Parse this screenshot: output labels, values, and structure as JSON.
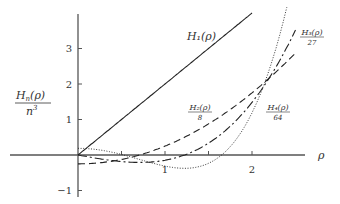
{
  "chart_data": {
    "type": "line",
    "title": "",
    "xlabel": "ρ",
    "ylabel": "H_n(ρ) / n^3",
    "ylabel_parts": {
      "num": "H",
      "num_sub": "n",
      "num_arg": "(ρ)",
      "den": "n",
      "den_sup": "3"
    },
    "xlim": [
      -0.9,
      2.5
    ],
    "ylim": [
      -1.15,
      4.0
    ],
    "x_ticks": [
      0.5,
      1,
      1.5,
      2
    ],
    "x_tick_labels": {
      "1": "1",
      "2": "2"
    },
    "y_ticks": [
      -1,
      1,
      2,
      3
    ],
    "y_tick_labels": [
      "−1",
      "1",
      "2",
      "3"
    ],
    "grid": false,
    "legend": "inline labels",
    "series": [
      {
        "name": "H1(ρ)",
        "label": "H₁(ρ)",
        "formula": "2ρ",
        "style": "solid",
        "domain": [
          0,
          2.0
        ],
        "x": [
          0,
          0.5,
          1.0,
          1.5,
          2.0
        ],
        "values": [
          0,
          1.0,
          2.0,
          3.0,
          4.0
        ]
      },
      {
        "name": "H2(ρ)/8",
        "label_num": "H₂(ρ)",
        "label_den": "8",
        "formula": "(4ρ²−2)/8",
        "style": "dashed",
        "domain": [
          0,
          2.5
        ],
        "x": [
          0,
          0.5,
          1.0,
          1.5,
          2.0,
          2.5
        ],
        "values": [
          -0.25,
          -0.125,
          0.25,
          0.875,
          1.75,
          2.875
        ]
      },
      {
        "name": "H3(ρ)/27",
        "label_num": "H₃(ρ)",
        "label_den": "27",
        "formula": "(8ρ³−12ρ)/27",
        "style": "dashdot",
        "domain": [
          0,
          2.5
        ],
        "x": [
          0,
          0.5,
          1.0,
          1.5,
          2.0,
          2.5
        ],
        "values": [
          0,
          -0.185,
          -0.148,
          0.333,
          1.482,
          3.519
        ]
      },
      {
        "name": "H4(ρ)/64",
        "label_num": "H₄(ρ)",
        "label_den": "64",
        "formula": "(16ρ⁴−48ρ²+12)/64",
        "style": "dotted",
        "domain": [
          0,
          2.42
        ],
        "x": [
          0,
          0.5,
          1.0,
          1.5,
          2.0,
          2.4
        ],
        "values": [
          0.1875,
          0.0156,
          -0.3125,
          -0.234,
          1.1875,
          3.164
        ]
      }
    ]
  },
  "colors": {
    "axis": "#555555",
    "line": "#222222"
  }
}
